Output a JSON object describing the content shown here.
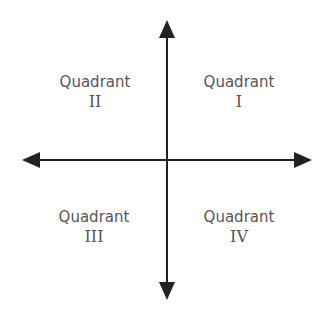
{
  "diagram": {
    "axis_color": "#222222",
    "label_color": "#555555",
    "quadrants": [
      {
        "word": "Quadrant",
        "numeral": "I",
        "position": "top-right"
      },
      {
        "word": "Quadrant",
        "numeral": "II",
        "position": "top-left"
      },
      {
        "word": "Quadrant",
        "numeral": "III",
        "position": "bottom-left"
      },
      {
        "word": "Quadrant",
        "numeral": "IV",
        "position": "bottom-right"
      }
    ]
  }
}
